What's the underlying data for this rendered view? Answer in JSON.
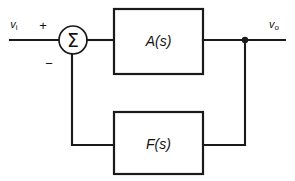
{
  "diagram": {
    "background_color": "#ffffff",
    "line_color": "#1a1a1a",
    "nodes": {
      "input_port": {
        "label_base": "v",
        "label_sub": "i",
        "name": "input-voltage-label"
      },
      "output_port": {
        "label_base": "v",
        "label_sub": "o",
        "name": "output-voltage-label"
      },
      "summing_junction": {
        "symbol": "Σ",
        "plus_sign": "+",
        "minus_sign": "−"
      },
      "forward_block": {
        "label": "A(s)"
      },
      "feedback_block": {
        "label": "F(s)"
      }
    },
    "geometry": {
      "canvas_width": 295,
      "canvas_height": 181,
      "sum_center_x": 73,
      "sum_center_y": 40,
      "sum_radius": 14,
      "forward_box": {
        "x": 114,
        "y": 9,
        "w": 89,
        "h": 65
      },
      "feedback_box": {
        "x": 114,
        "y": 112,
        "w": 89,
        "h": 62
      },
      "tap_x": 245,
      "tap_y": 40,
      "feedback_y": 145,
      "input_line_start_x": 10,
      "output_line_end_x": 285
    }
  }
}
